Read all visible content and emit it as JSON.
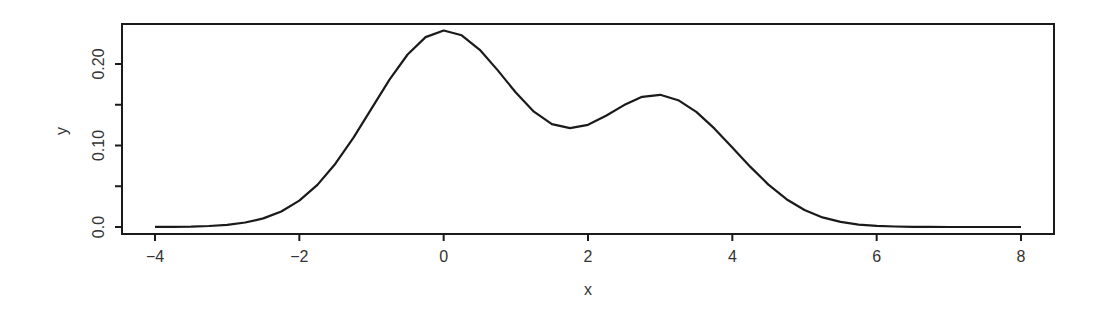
{
  "chart_data": {
    "type": "line",
    "title": "",
    "xlabel": "x",
    "ylabel": "y",
    "xlim": [
      -4.4,
      8.45
    ],
    "ylim": [
      -0.0075,
      0.2525
    ],
    "grid": false,
    "legend": null,
    "x_ticks": [
      -4,
      -2,
      0,
      2,
      4,
      6,
      8
    ],
    "x_tick_labels": [
      "−4",
      "−2",
      "0",
      "2",
      "4",
      "6",
      "8"
    ],
    "y_ticks": [
      0.0,
      0.05,
      0.1,
      0.15,
      0.2
    ],
    "y_tick_labels": [
      "0.0",
      "",
      "0.10",
      "",
      "0.20"
    ],
    "line_color": "#1a1a1a",
    "series": [
      {
        "name": "density",
        "x": [
          -4.0,
          -3.75,
          -3.5,
          -3.25,
          -3.0,
          -2.75,
          -2.5,
          -2.25,
          -2.0,
          -1.75,
          -1.5,
          -1.25,
          -1.0,
          -0.75,
          -0.5,
          -0.25,
          0.0,
          0.25,
          0.5,
          0.75,
          1.0,
          1.25,
          1.5,
          1.75,
          2.0,
          2.25,
          2.5,
          2.75,
          3.0,
          3.25,
          3.5,
          3.75,
          4.0,
          4.25,
          4.5,
          4.75,
          5.0,
          5.25,
          5.5,
          5.75,
          6.0,
          6.25,
          6.5,
          6.75,
          7.0,
          7.25,
          7.5,
          7.75,
          8.0
        ],
        "y": [
          0.0001,
          0.0002,
          0.0005,
          0.0012,
          0.0027,
          0.0055,
          0.0105,
          0.019,
          0.0324,
          0.0517,
          0.0777,
          0.1097,
          0.1452,
          0.1807,
          0.2116,
          0.233,
          0.2411,
          0.2352,
          0.2174,
          0.1922,
          0.165,
          0.1415,
          0.1262,
          0.1213,
          0.1254,
          0.1364,
          0.1496,
          0.1598,
          0.1622,
          0.1556,
          0.1412,
          0.121,
          0.0976,
          0.0738,
          0.052,
          0.0341,
          0.0208,
          0.0118,
          0.0062,
          0.003,
          0.0014,
          0.0006,
          0.0002,
          0.0001,
          0.0,
          0.0,
          0.0,
          0.0,
          0.0
        ]
      }
    ]
  }
}
